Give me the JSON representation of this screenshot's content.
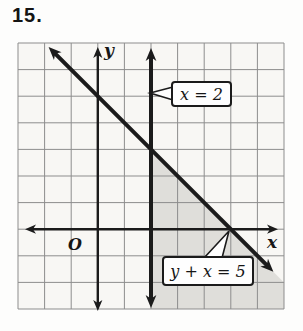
{
  "problem_number": "15.",
  "figure": {
    "y_axis_label": "y",
    "x_axis_label": "x",
    "origin_label": "O",
    "callouts": [
      {
        "text": "x = 2",
        "points_to": "vertical line x = 2",
        "box": {
          "left": 171,
          "top": 81,
          "width": 61,
          "height": 26
        },
        "tail": [
          [
            173,
            87
          ],
          [
            150,
            93
          ],
          [
            173,
            100
          ]
        ]
      },
      {
        "text": "y + x = 5",
        "points_to": "x-intercept (5, 0) of line y + x = 5",
        "box": {
          "left": 162,
          "top": 256,
          "width": 92,
          "height": 30
        },
        "tail": [
          [
            204,
            258
          ],
          [
            229,
            231
          ],
          [
            222,
            258
          ]
        ]
      }
    ]
  },
  "chart_data": {
    "type": "line",
    "x_range": [
      -3,
      7
    ],
    "y_range": [
      -3,
      7
    ],
    "grid": "on",
    "xlabel": "x",
    "ylabel": "y",
    "series": [
      {
        "name": "x = 2",
        "points": [
          [
            2,
            -3
          ],
          [
            2,
            7
          ]
        ]
      },
      {
        "name": "y + x = 5",
        "points": [
          [
            -2,
            7
          ],
          [
            7,
            -2
          ]
        ]
      }
    ],
    "shaded_region": {
      "rule": "x >= 2 and y + x <= 5",
      "vertices": [
        [
          2,
          3
        ],
        [
          7,
          -2
        ],
        [
          7,
          -3
        ],
        [
          2,
          -3
        ]
      ]
    },
    "lines_intersection": [
      2,
      3
    ]
  },
  "colors": {
    "ink": "#1b1b1b",
    "grid_line": "#8d8d8d",
    "grid_bg": "#f8f7f4",
    "shading": "#dfdeda",
    "callout_bg": "#fefefe"
  }
}
